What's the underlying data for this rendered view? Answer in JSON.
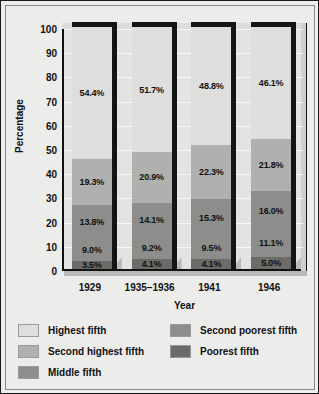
{
  "chart_data": {
    "type": "bar",
    "subtype": "stacked-100-percent-3d",
    "title": "",
    "xlabel": "Year",
    "ylabel": "Percentage",
    "ylim": [
      0,
      100
    ],
    "yticks": [
      100,
      90,
      80,
      70,
      60,
      50,
      40,
      30,
      20,
      10,
      0
    ],
    "grid": true,
    "legend_position": "bottom",
    "categories": [
      "1929",
      "1935–1936",
      "1941",
      "1946"
    ],
    "stack_order_bottom_to_top": [
      "Poorest fifth",
      "Second poorest fifth",
      "Middle fifth",
      "Second highest fifth",
      "Highest fifth"
    ],
    "series": [
      {
        "name": "Highest fifth",
        "color": "#dededc",
        "values": [
          54.4,
          51.7,
          48.8,
          46.1
        ],
        "labels": [
          "54.4%",
          "51.7%",
          "48.8%",
          "46.1%"
        ]
      },
      {
        "name": "Second highest fifth",
        "color": "#b0b0ae",
        "values": [
          19.3,
          20.9,
          22.3,
          21.8
        ],
        "labels": [
          "19.3%",
          "20.9%",
          "22.3%",
          "21.8%"
        ]
      },
      {
        "name": "Middle fifth",
        "color": "#8d8d8b",
        "values": [
          13.8,
          14.1,
          15.3,
          16.0
        ],
        "labels": [
          "13.8%",
          "14.1%",
          "15.3%",
          "16.0%"
        ]
      },
      {
        "name": "Second poorest fifth",
        "color": "#8d8d8b",
        "values": [
          9.0,
          9.2,
          9.5,
          11.1
        ],
        "labels": [
          "9.0%",
          "9.2%",
          "9.5%",
          "11.1%"
        ]
      },
      {
        "name": "Poorest fifth",
        "color": "#6b6b69",
        "values": [
          3.5,
          4.1,
          4.1,
          5.0
        ],
        "labels": [
          "3.5%",
          "4.1%",
          "4.1%",
          "5.0%"
        ]
      }
    ]
  },
  "legend": {
    "items": [
      {
        "label": "Highest fifth",
        "color": "#dededc"
      },
      {
        "label": "Second highest fifth",
        "color": "#b0b0ae"
      },
      {
        "label": "Middle fifth",
        "color": "#8d8d8b"
      },
      {
        "label": "Second poorest fifth",
        "color": "#8d8d8b"
      },
      {
        "label": "Poorest fifth",
        "color": "#6b6b69"
      }
    ]
  }
}
